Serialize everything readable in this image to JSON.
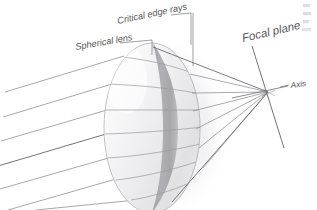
{
  "figure": {
    "kind": "optics-ray-diagram",
    "title_visible": false,
    "background_color": "#ffffff",
    "width": 317,
    "height": 210,
    "labels": {
      "spherical_lens": "Spherical lens",
      "critical_edge_rays": "Critical edge rays",
      "focal_plane": "Focal plane",
      "axis": "Axis"
    },
    "colors": {
      "label_text": "#58585a",
      "ray_line": "#8a8a8f",
      "ray_line_dark": "#6d6d72",
      "leader_line": "#76767b",
      "lens_outline": "#b6b6ba",
      "lens_body_light": "#fbfbfb",
      "lens_body_mid": "#ececee",
      "lens_band_dark": "#a9a9ad",
      "lens_shadow": "#e8e8ea",
      "focal_plane_line": "#6d6d72",
      "axis_line": "#6d6d72",
      "bleed_text": "#b9b9bb"
    },
    "geometry": {
      "focal_point": {
        "x": 268,
        "y": 92
      },
      "lens_center": {
        "x": 152,
        "y": 128
      },
      "lens_radius_x": 48,
      "lens_radius_y": 85,
      "axis_label_position": {
        "x": 292,
        "y": 86
      },
      "focal_plane_top": {
        "x": 252,
        "y": 48
      },
      "focal_plane_bottom": {
        "x": 283,
        "y": 146
      }
    },
    "ray_count_incoming": 7,
    "bleed_text_fragments": [
      "th",
      "th",
      "th"
    ]
  }
}
